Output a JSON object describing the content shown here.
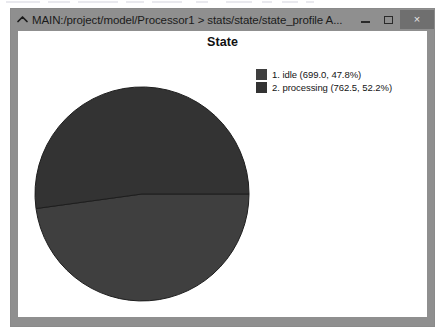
{
  "window": {
    "title": "MAIN:/project/model/Processor1 > stats/state/state_profile A...",
    "collapse_icon": "chevron-up-icon",
    "buttons": {
      "minimize_label": "",
      "maximize_label": "",
      "close_label": "×"
    }
  },
  "chart_data": {
    "type": "pie",
    "title": "State",
    "xlabel": "",
    "ylabel": "",
    "legend_position": "top-right",
    "grid": false,
    "start_angle_deg": 0,
    "direction": "clockwise",
    "total": 1461.5,
    "categories": [
      "idle",
      "processing"
    ],
    "values": [
      699.0,
      762.5
    ],
    "percentages": [
      47.8,
      52.2
    ],
    "colors": [
      "#3f3f3f",
      "#333333"
    ],
    "slices": [
      {
        "index": 1,
        "name": "idle",
        "value": 699.0,
        "percent": 47.8,
        "color": "#3f3f3f",
        "legend_label": "1. idle (699.0, 47.8%)"
      },
      {
        "index": 2,
        "name": "processing",
        "value": 762.5,
        "percent": 52.2,
        "color": "#333333",
        "legend_label": "2. processing (762.5, 52.2%)"
      }
    ]
  },
  "colors": {
    "window_frame": "#8f8f8f",
    "content_background": "#ffffff",
    "close_button": "#6f6f6f",
    "slice_border": "#1e1e1e",
    "text": "#141414"
  }
}
